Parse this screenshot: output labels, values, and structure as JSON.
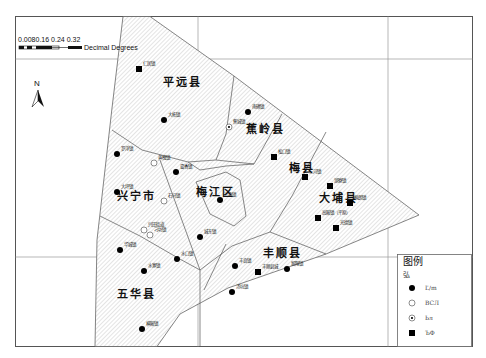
{
  "scale_bar": {
    "ticks_label": "0.0080.16 0.24 0.32",
    "ticks_prefix": "0.",
    "units": "Decimal Degrees"
  },
  "north_arrow": {
    "label": "N"
  },
  "counties": [
    {
      "name": "平远县",
      "x": 182,
      "y": 86
    },
    {
      "name": "蕉岭县",
      "x": 265,
      "y": 133
    },
    {
      "name": "梅县",
      "x": 302,
      "y": 172
    },
    {
      "name": "大埔县",
      "x": 338,
      "y": 202
    },
    {
      "name": "兴宁市",
      "x": 136,
      "y": 200
    },
    {
      "name": "梅江区",
      "x": 215,
      "y": 196
    },
    {
      "name": "丰顺县",
      "x": 282,
      "y": 257
    },
    {
      "name": "五华县",
      "x": 136,
      "y": 298
    }
  ],
  "towns": [
    {
      "name": "仁居镇",
      "type": "square",
      "x": 139,
      "y": 69
    },
    {
      "name": "大柘镇",
      "type": "filled-circle",
      "x": 164,
      "y": 120
    },
    {
      "name": "南礤镇",
      "type": "filled-circle",
      "x": 248,
      "y": 112
    },
    {
      "name": "蕉城镇",
      "type": "dot-circle",
      "x": 229,
      "y": 127
    },
    {
      "name": "松口镇",
      "type": "square",
      "x": 274,
      "y": 157
    },
    {
      "name": "三河镇",
      "type": "square",
      "x": 305,
      "y": 177
    },
    {
      "name": "湖寮镇",
      "type": "square",
      "x": 330,
      "y": 186
    },
    {
      "name": "枫朗镇",
      "type": "square",
      "x": 350,
      "y": 203
    },
    {
      "name": "高陂镇（平原）",
      "type": "square",
      "x": 318,
      "y": 218
    },
    {
      "name": "光德镇",
      "type": "square",
      "x": 336,
      "y": 228
    },
    {
      "name": "罗浮镇",
      "type": "filled-circle",
      "x": 117,
      "y": 154
    },
    {
      "name": "黄槐镇",
      "type": "open-circle",
      "x": 154,
      "y": 163
    },
    {
      "name": "畲香镇",
      "type": "filled-circle",
      "x": 176,
      "y": 172
    },
    {
      "name": "大坪镇",
      "type": "filled-circle",
      "x": 117,
      "y": 192
    },
    {
      "name": "石马镇",
      "type": "open-circle",
      "x": 164,
      "y": 201
    },
    {
      "name": "三角镇",
      "type": "filled-circle",
      "x": 220,
      "y": 200
    },
    {
      "name": "兴田街道",
      "type": "open-circle",
      "x": 144,
      "y": 230
    },
    {
      "name": "刁坊镇",
      "type": "open-circle",
      "x": 150,
      "y": 235
    },
    {
      "name": "城东镇",
      "type": "filled-circle",
      "x": 200,
      "y": 237
    },
    {
      "name": "华城镇",
      "type": "filled-circle",
      "x": 120,
      "y": 250
    },
    {
      "name": "水口镇",
      "type": "filled-circle",
      "x": 177,
      "y": 259
    },
    {
      "name": "水寨镇",
      "type": "filled-circle",
      "x": 144,
      "y": 271
    },
    {
      "name": "丰良镇",
      "type": "filled-circle",
      "x": 235,
      "y": 266
    },
    {
      "name": "丰顺县城",
      "type": "square",
      "x": 258,
      "y": 272
    },
    {
      "name": "留隍镇",
      "type": "filled-circle",
      "x": 287,
      "y": 269
    },
    {
      "name": "汤坑镇",
      "type": "filled-circle",
      "x": 232,
      "y": 292
    },
    {
      "name": "横陂镇",
      "type": "filled-circle",
      "x": 142,
      "y": 329
    }
  ],
  "legend": {
    "title": "图例",
    "subtitle": "弘",
    "items": [
      {
        "symbol": "filled-circle",
        "label": "Ľ/m"
      },
      {
        "symbol": "open-circle",
        "label": "ВСЛ"
      },
      {
        "symbol": "dot-circle",
        "label": "Ьл"
      },
      {
        "symbol": "square",
        "label": "ЪФ"
      }
    ]
  }
}
